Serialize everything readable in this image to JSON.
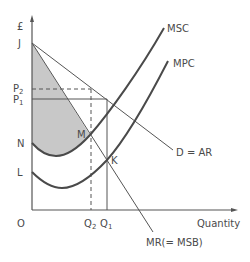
{
  "diagram": {
    "y_axis_label": "£",
    "x_axis_label": "Quantity",
    "origin_label": "O",
    "price_labels": {
      "J": "J",
      "P2": "P",
      "P2_sub": "2",
      "P1": "P",
      "P1_sub": "1",
      "N": "N",
      "L": "L"
    },
    "quantity_labels": {
      "Q2": "Q",
      "Q2_sub": "2",
      "Q1": "Q",
      "Q1_sub": "1"
    },
    "curve_labels": {
      "msc": "MSC",
      "mpc": "MPC",
      "demand": "D = AR",
      "mr": "MR(= MSB)"
    },
    "point_labels": {
      "M": "M",
      "K": "K"
    },
    "colors": {
      "line": "#4a4a4a",
      "thin_line": "#555555",
      "shade": "#c8c8c8",
      "background": "#ffffff"
    }
  }
}
